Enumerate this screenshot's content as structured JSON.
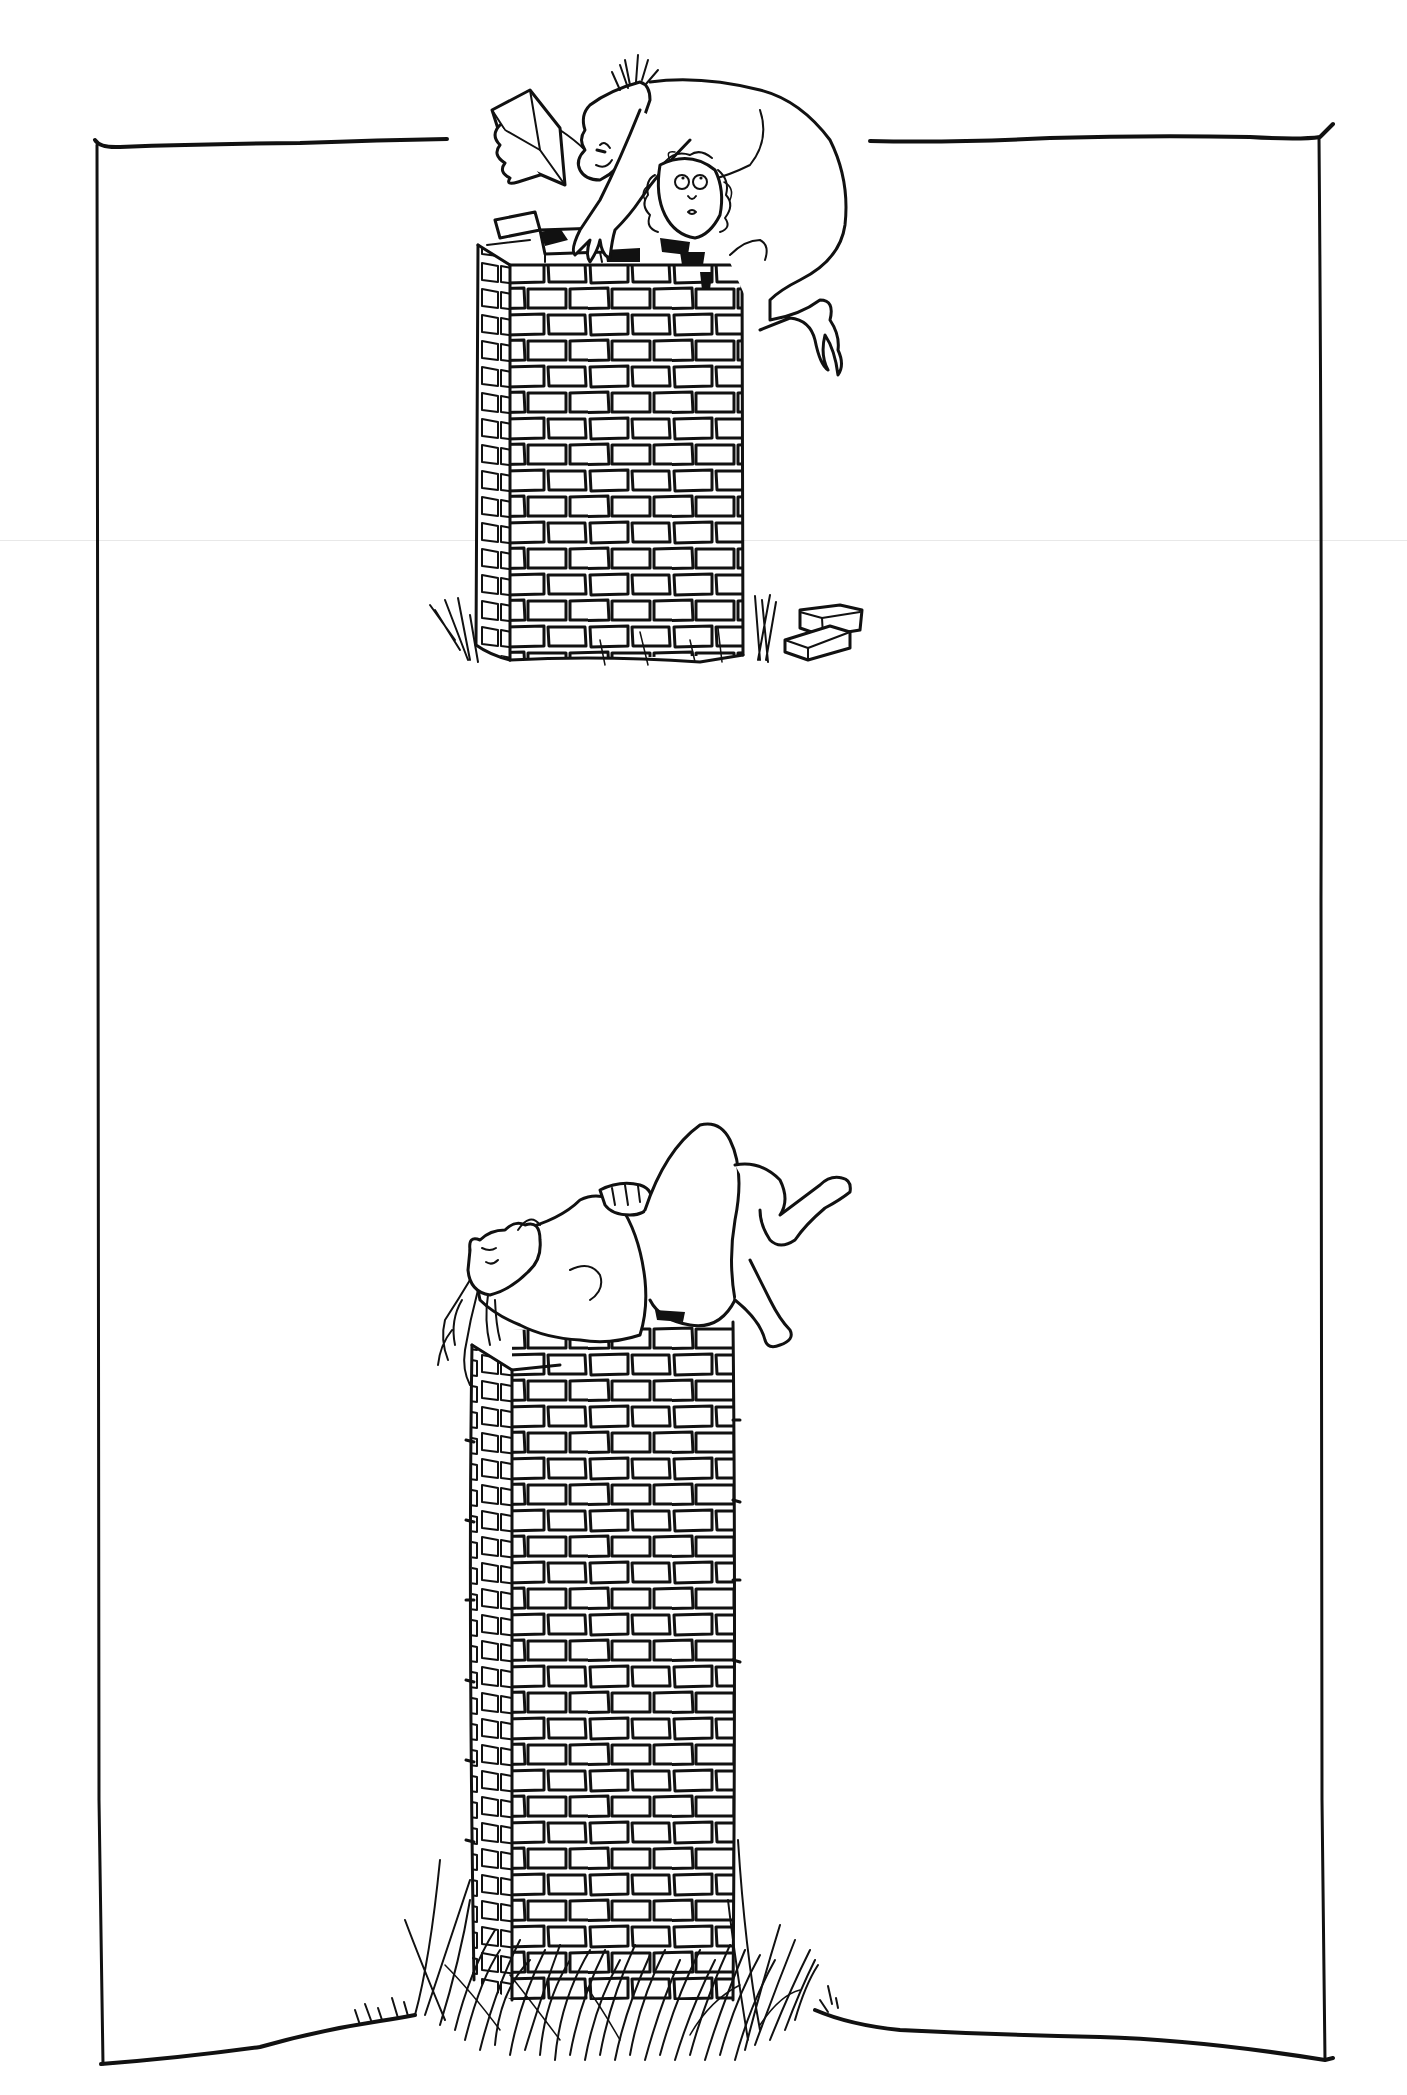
{
  "illustration": {
    "title": "",
    "style": "pen-and-ink cartoon",
    "colors": {
      "ink": "#111111",
      "paper": "#ffffff",
      "fold_line": "#e8e8e8"
    },
    "frame": {
      "top_left": [
        95,
        145
      ],
      "top_gap": [
        447,
        870
      ],
      "top_right": [
        1320,
        137
      ],
      "bottom_left": [
        103,
        2064
      ],
      "bottom_right": [
        1325,
        2060
      ]
    },
    "panels": [
      {
        "id": "top",
        "description": "Two figures crouched atop a brick chimney; one holds a brick over the other's head",
        "chimney": {
          "x": 475,
          "y": 210,
          "width": 268,
          "height": 450
        },
        "loose_bricks": 2
      },
      {
        "id": "bottom",
        "description": "A single figure lying on its back atop a taller brick chimney surrounded by tall grass",
        "chimney": {
          "x": 472,
          "y": 1330,
          "width": 261,
          "height": 690
        },
        "grass": true
      }
    ]
  }
}
